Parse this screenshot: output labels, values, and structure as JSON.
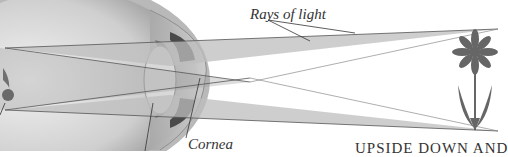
{
  "diagram": {
    "labels": {
      "rays": "Rays of light",
      "cornea": "Cornea",
      "caption": "UPSIDE DOWN AND"
    },
    "colors": {
      "background": "#ffffff",
      "eyeball_fill": "#c8c8c8",
      "eyeball_outline": "#8a8a8a",
      "ray_fill": "#bdbdbd",
      "ray_edge": "#555555",
      "flower": "#666666",
      "retina_image": "#707070",
      "text": "#333333"
    },
    "elements": [
      {
        "name": "eyeball",
        "desc": "cross-section of eye on the left"
      },
      {
        "name": "lens",
        "desc": "biconvex lens inside eye"
      },
      {
        "name": "iris",
        "desc": "dark iris segments above and below lens"
      },
      {
        "name": "cornea",
        "desc": "bulging front surface"
      },
      {
        "name": "light-rays",
        "desc": "two crossing ray cones from flower to retina"
      },
      {
        "name": "flower-object",
        "desc": "upright flower on the right"
      },
      {
        "name": "inverted-image",
        "desc": "upside-down image on retina"
      }
    ]
  }
}
